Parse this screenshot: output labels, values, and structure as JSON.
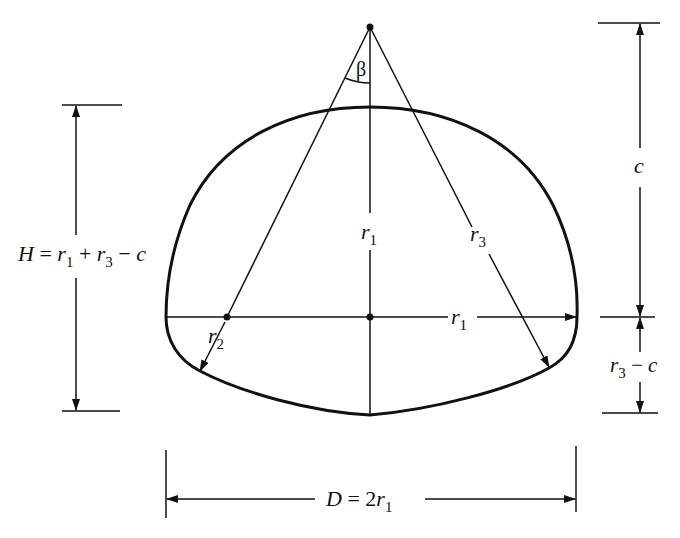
{
  "diagram": {
    "stroke_color": "#111111",
    "background": "#ffffff",
    "labels": {
      "angle": "β",
      "r1_vertical": "r",
      "r1_vertical_sub": "1",
      "r1_horizontal": "r",
      "r1_horizontal_sub": "1",
      "r2": "r",
      "r2_sub": "2",
      "r3": "r",
      "r3_sub": "3",
      "c": "c",
      "height_H": {
        "H": "H",
        "eq": " = ",
        "r": "r",
        "sub1": "1",
        "plus": " + ",
        "r3": "r",
        "sub3": "3",
        "minus": " − ",
        "c": "c"
      },
      "r3_minus_c": {
        "r": "r",
        "sub": "3",
        "minus": " − ",
        "c": "c"
      },
      "diameter": {
        "D": "D",
        "eq": " = 2",
        "r": "r",
        "sub": "1"
      }
    },
    "dimensions": [
      {
        "name": "H",
        "expression": "H = r1 + r3 − c",
        "orientation": "vertical",
        "side": "left"
      },
      {
        "name": "c",
        "expression": "c",
        "orientation": "vertical",
        "side": "right-upper"
      },
      {
        "name": "r3-c",
        "expression": "r3 − c",
        "orientation": "vertical",
        "side": "right-lower"
      },
      {
        "name": "D",
        "expression": "D = 2r1",
        "orientation": "horizontal",
        "side": "bottom"
      }
    ],
    "radii": [
      "r1",
      "r2",
      "r3"
    ],
    "angle": "β"
  }
}
